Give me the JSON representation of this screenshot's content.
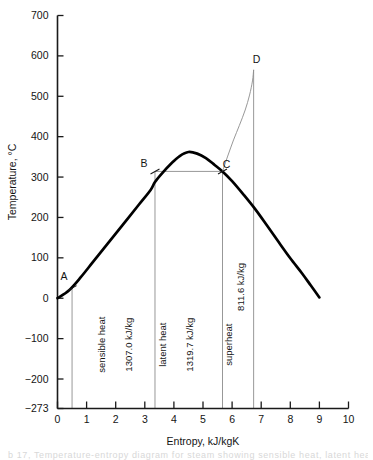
{
  "chart_data": {
    "type": "line",
    "title": "",
    "xlabel": "Entropy, kJ/kgK",
    "ylabel": "Temperature, °C",
    "xlim": [
      0,
      10
    ],
    "ylim": [
      -273,
      700
    ],
    "grid": false,
    "legend": "none",
    "xticks": [
      "0",
      "1",
      "2",
      "3",
      "4",
      "5",
      "6",
      "7",
      "8",
      "9",
      "10"
    ],
    "xtick_values": [
      0,
      1,
      2,
      3,
      4,
      5,
      6,
      7,
      8,
      9,
      10
    ],
    "yticks": [
      "700",
      "600",
      "500",
      "400",
      "300",
      "200",
      "100",
      "0",
      "−100",
      "−200",
      "−273"
    ],
    "ytick_values": [
      700,
      600,
      500,
      400,
      300,
      200,
      100,
      0,
      -100,
      -200,
      -273
    ],
    "series": [
      {
        "name": "saturation dome",
        "style": "thick-solid",
        "points": [
          [
            0.0,
            0
          ],
          [
            0.4,
            20
          ],
          [
            0.8,
            52
          ],
          [
            1.2,
            88
          ],
          [
            1.6,
            124
          ],
          [
            2.0,
            160
          ],
          [
            2.4,
            196
          ],
          [
            2.8,
            232
          ],
          [
            3.2,
            268
          ],
          [
            3.35,
            288
          ],
          [
            3.6,
            310
          ],
          [
            3.9,
            333
          ],
          [
            4.2,
            352
          ],
          [
            4.5,
            362
          ],
          [
            4.8,
            358
          ],
          [
            5.1,
            347
          ],
          [
            5.4,
            330
          ],
          [
            5.67,
            314
          ],
          [
            6.0,
            290
          ],
          [
            6.4,
            256
          ],
          [
            6.8,
            220
          ],
          [
            7.2,
            180
          ],
          [
            7.6,
            139
          ],
          [
            8.0,
            99
          ],
          [
            8.4,
            62
          ],
          [
            8.7,
            32
          ],
          [
            9.0,
            2
          ]
        ]
      },
      {
        "name": "superheat line C to D",
        "style": "thin-solid",
        "points": [
          [
            5.67,
            314
          ],
          [
            5.85,
            352
          ],
          [
            6.05,
            392
          ],
          [
            6.25,
            428
          ],
          [
            6.45,
            466
          ],
          [
            6.6,
            503
          ],
          [
            6.7,
            538
          ],
          [
            6.74,
            565
          ]
        ]
      }
    ],
    "annotated_points": [
      {
        "label": "A",
        "s": 0.5,
        "t": 25,
        "label_dx": -8,
        "label_dy": -8
      },
      {
        "label": "B",
        "s": 3.35,
        "t": 314,
        "label_dx": -11,
        "label_dy": -4
      },
      {
        "label": "C",
        "s": 5.67,
        "t": 314,
        "label_dx": 4,
        "label_dy": -3
      },
      {
        "label": "D",
        "s": 6.74,
        "t": 565,
        "label_dx": 3,
        "label_dy": -7
      }
    ],
    "vertical_lines": [
      {
        "name": "line-A",
        "s": 0.5,
        "t_top": 25
      },
      {
        "name": "line-B",
        "s": 3.35,
        "t_top": 314
      },
      {
        "name": "line-C",
        "s": 5.67,
        "t_top": 314
      },
      {
        "name": "line-D",
        "s": 6.74,
        "t_top": 565
      }
    ],
    "horizontal_lines": [
      {
        "name": "line-BC",
        "t": 314,
        "s_start": 3.35,
        "s_end": 5.67
      }
    ],
    "band_labels": [
      {
        "name": "sensible-heat",
        "text": "sensible heat",
        "s": 1.62,
        "t": -115
      },
      {
        "name": "sensible-heat-value",
        "text": "1307.0 kJ/kg",
        "s": 2.55,
        "t": -115
      },
      {
        "name": "latent-heat",
        "text": "latent heat",
        "s": 3.72,
        "t": -115
      },
      {
        "name": "latent-heat-value",
        "text": "1319.7 kJ/kg",
        "s": 4.65,
        "t": -115
      },
      {
        "name": "superheat",
        "text": "superheat",
        "s": 5.98,
        "t": -115
      },
      {
        "name": "superheat-value",
        "text": "811.6 kJ/kg",
        "s": 6.4,
        "t": 28
      }
    ],
    "colors": {
      "curve": "#000000",
      "axis": "#1a1a1a",
      "thin_line": "#8c8c8c",
      "text": "#141414",
      "background": "#ffffff"
    }
  },
  "caption": {
    "ghost_text": "b 17, Temperature-entropy diagram for steam showing sensible heat, latent heat"
  }
}
